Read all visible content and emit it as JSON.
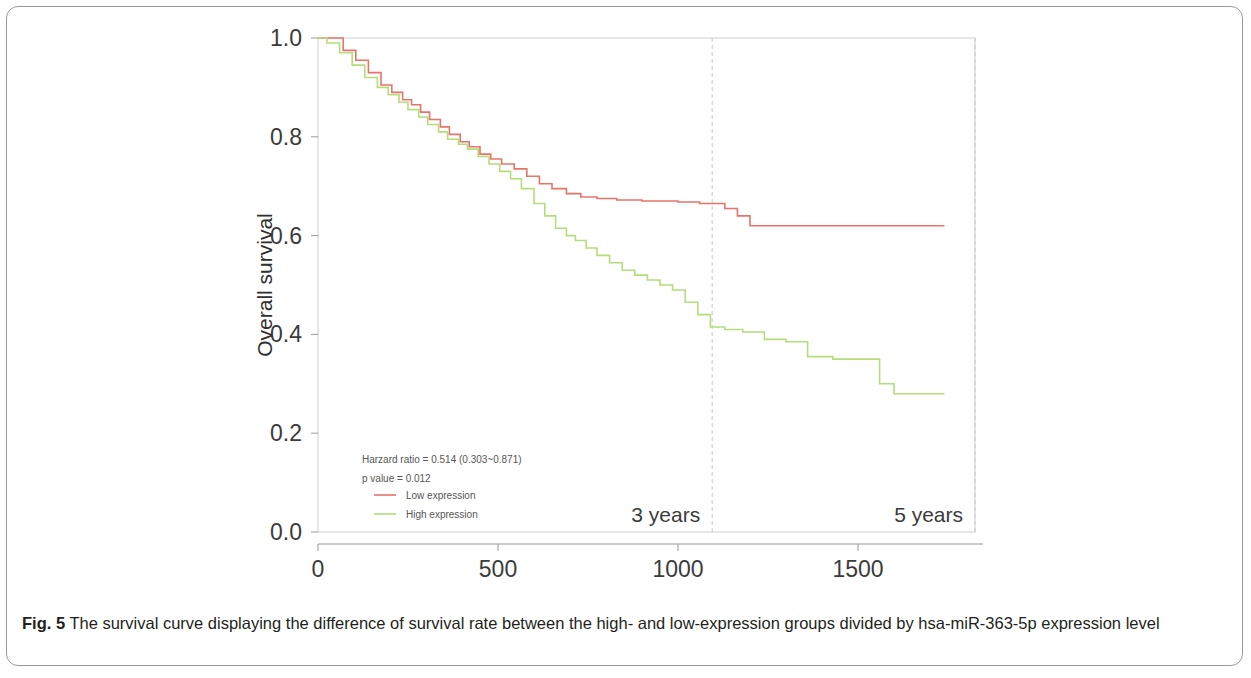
{
  "figure": {
    "caption_label": "Fig. 5",
    "caption_text": " The survival curve displaying the difference of survival rate between the high- and low-expression groups divided by hsa-miR-363-5p expression level"
  },
  "annotations": {
    "hazard_ratio": "Harzard ratio = 0.514 (0.303~0.871)",
    "p_value": "p value = 0.012",
    "marker_3_years": "3 years",
    "marker_5_years": "5 years"
  },
  "colors": {
    "low_expression": "#e8736b",
    "high_expression": "#b5dd7a",
    "axis": "#9a9a9a",
    "marker_line": "#c8c8c8",
    "text": "#3b3b3b"
  },
  "chart_data": {
    "type": "line",
    "title": "",
    "subtitle": "",
    "xlabel": "Days",
    "ylabel": "Overall survival",
    "xlim": [
      0,
      1825
    ],
    "ylim": [
      0,
      1.0
    ],
    "xticks": [
      0,
      500,
      1000,
      1500
    ],
    "xticklabels": [
      "0",
      "500",
      "1000",
      "1500"
    ],
    "yticks": [
      0.0,
      0.2,
      0.4,
      0.6,
      0.8,
      1.0
    ],
    "yticklabels": [
      "0.0",
      "0.2",
      "0.4",
      "0.6",
      "0.8",
      "1.0"
    ],
    "grid": false,
    "legend_position": "lower-left-inside",
    "step_type": "post",
    "vertical_markers": [
      {
        "x": 1095,
        "label": "3 years"
      },
      {
        "x": 1825,
        "label": "5 years"
      }
    ],
    "series": [
      {
        "name": "Low expression",
        "color": "#e8736b",
        "x": [
          0,
          30,
          70,
          105,
          140,
          175,
          205,
          235,
          260,
          285,
          310,
          340,
          365,
          395,
          420,
          450,
          480,
          510,
          545,
          580,
          615,
          650,
          690,
          730,
          775,
          830,
          900,
          1000,
          1060,
          1130,
          1165,
          1200,
          1740
        ],
        "y": [
          1.0,
          1.0,
          0.975,
          0.955,
          0.93,
          0.905,
          0.89,
          0.875,
          0.865,
          0.85,
          0.835,
          0.82,
          0.805,
          0.79,
          0.78,
          0.765,
          0.755,
          0.745,
          0.735,
          0.72,
          0.705,
          0.695,
          0.685,
          0.678,
          0.675,
          0.672,
          0.67,
          0.668,
          0.665,
          0.655,
          0.64,
          0.62,
          0.62
        ]
      },
      {
        "name": "High expression",
        "color": "#b5dd7a",
        "x": [
          0,
          25,
          60,
          95,
          130,
          165,
          195,
          225,
          250,
          280,
          305,
          335,
          360,
          390,
          415,
          445,
          475,
          505,
          535,
          565,
          600,
          630,
          660,
          690,
          715,
          745,
          775,
          810,
          845,
          880,
          915,
          950,
          985,
          1020,
          1055,
          1090,
          1130,
          1180,
          1240,
          1300,
          1360,
          1430,
          1500,
          1560,
          1600,
          1740
        ],
        "y": [
          1.0,
          0.99,
          0.97,
          0.945,
          0.92,
          0.9,
          0.885,
          0.87,
          0.855,
          0.84,
          0.825,
          0.81,
          0.795,
          0.785,
          0.775,
          0.76,
          0.745,
          0.73,
          0.715,
          0.695,
          0.665,
          0.64,
          0.615,
          0.6,
          0.59,
          0.575,
          0.56,
          0.545,
          0.53,
          0.52,
          0.51,
          0.5,
          0.49,
          0.465,
          0.44,
          0.415,
          0.41,
          0.405,
          0.39,
          0.385,
          0.355,
          0.35,
          0.35,
          0.3,
          0.28,
          0.28
        ]
      }
    ]
  }
}
